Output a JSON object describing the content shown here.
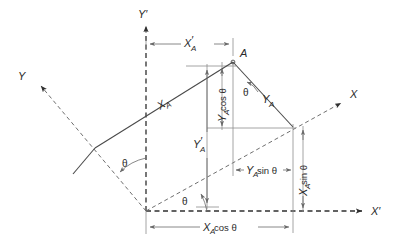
{
  "figure": {
    "type": "vector-diagram",
    "background_color": "#ffffff",
    "line_color": "#4a4a4a",
    "axis_color": "#2f2f2f",
    "dim_color": "#6a6a6a",
    "rotation_angle_symbol": "θ"
  },
  "axes": [
    {
      "id": "y-prime",
      "label": "Y",
      "prime": "′",
      "style": "dashed",
      "direction": "up",
      "from": [
        146,
        211
      ],
      "to": [
        146,
        22
      ],
      "arrow": true
    },
    {
      "id": "x-prime",
      "label": "X",
      "prime": "′",
      "style": "dashed",
      "direction": "right",
      "from": [
        146,
        211
      ],
      "to": [
        366,
        211
      ],
      "arrow": true
    },
    {
      "id": "y-axis",
      "label": "Y",
      "prime": "",
      "style": "dashed",
      "direction": "up-left",
      "from": [
        146,
        211
      ],
      "to": [
        37,
        82
      ],
      "arrow": true
    },
    {
      "id": "x-axis",
      "label": "X",
      "prime": "",
      "style": "dashed",
      "direction": "up-right",
      "from": [
        146,
        211
      ],
      "to": [
        345,
        100
      ],
      "arrow": true
    }
  ],
  "axis_labels": {
    "y_prime": {
      "text": "Y′",
      "x": 140,
      "y": 18
    },
    "x_prime": {
      "text": "X′",
      "x": 372,
      "y": 214
    },
    "y": {
      "text": "Y",
      "x": 22,
      "y": 76
    },
    "x": {
      "text": "X",
      "x": 352,
      "y": 94
    }
  },
  "point": {
    "name": "A",
    "label": "A",
    "label_x": 240,
    "label_y": 55,
    "x": 233,
    "y": 62
  },
  "vectors": [
    {
      "id": "x-a-vector",
      "label": "X",
      "sub": "A",
      "description": "Component of A along rotated X axis, drawn from the foot on the Y axis up to point A",
      "from": [
        95,
        148
      ],
      "to": [
        233,
        62
      ],
      "label_x": 163,
      "label_y": 107,
      "label_rotate": -32
    },
    {
      "id": "y-a-vector",
      "label": "Y",
      "sub": "A",
      "description": "Component of A along rotated Y axis, drawn from point A down to the X axis",
      "from": [
        233,
        62
      ],
      "to": [
        293,
        127
      ],
      "label_x": 266,
      "label_y": 103,
      "label_rotate": 0
    }
  ],
  "dimensions": [
    {
      "id": "x-prime-a",
      "text": "X",
      "sub": "A",
      "prime": "′",
      "suffix": "",
      "orientation": "horizontal",
      "from": [
        146,
        44
      ],
      "to": [
        233,
        44
      ],
      "label_x": 186,
      "label_y": 41,
      "description": "X' coordinate of point A"
    },
    {
      "id": "y-prime-a",
      "text": "Y",
      "sub": "A",
      "prime": "′",
      "suffix": "",
      "orientation": "vertical",
      "from": [
        207,
        67
      ],
      "to": [
        207,
        207
      ],
      "label_x": 198,
      "label_y": 145,
      "description": "Y' coordinate of point A"
    },
    {
      "id": "y-a-cos-theta",
      "text": "Y",
      "sub": "A",
      "prime": "",
      "suffix": " cos θ",
      "orientation": "vertical",
      "from": [
        222,
        66
      ],
      "to": [
        222,
        128
      ],
      "label_x": 219,
      "label_y": 97,
      "description": "Vertical projection of the Y_A component"
    },
    {
      "id": "y-a-sin-theta",
      "text": "Y",
      "sub": "A",
      "prime": "",
      "suffix": " sin θ",
      "orientation": "horizontal",
      "from": [
        233,
        170
      ],
      "to": [
        293,
        170
      ],
      "label_x": 263,
      "label_y": 167,
      "description": "Horizontal projection of the Y_A component"
    },
    {
      "id": "x-a-sin-theta",
      "text": "X",
      "sub": "A",
      "prime": "",
      "suffix": " sin θ",
      "orientation": "vertical",
      "from": [
        303,
        128
      ],
      "to": [
        303,
        210
      ],
      "label_x": 300,
      "label_y": 170,
      "description": "Vertical projection of the X_A component"
    },
    {
      "id": "x-a-cos-theta",
      "text": "X",
      "sub": "A",
      "prime": "",
      "suffix": " cos θ",
      "orientation": "horizontal",
      "from": [
        146,
        227
      ],
      "to": [
        293,
        227
      ],
      "label_x": 220,
      "label_y": 236,
      "description": "Horizontal projection of the X_A component"
    }
  ],
  "angles": [
    {
      "id": "theta-at-point-a",
      "label": "θ",
      "x": 249,
      "y": 95,
      "description": "Angle at A between the vertical drop line and the Y_A component"
    },
    {
      "id": "theta-yy-prime",
      "label": "θ",
      "x": 126,
      "y": 167,
      "description": "Rotation angle between the Y axis and the Y' axis"
    },
    {
      "id": "theta-xx-prime",
      "label": "θ",
      "x": 186,
      "y": 202,
      "description": "Rotation angle between the X axis and the X' axis"
    }
  ],
  "construction_lines": [
    {
      "id": "a-drop-line",
      "from": [
        233,
        62
      ],
      "to": [
        233,
        174
      ],
      "description": "Vertical drop from A"
    },
    {
      "id": "a-top-horizontal",
      "from": [
        186,
        66
      ],
      "to": [
        233,
        66
      ],
      "description": "Horizontal tick at top of Y_A cos theta"
    },
    {
      "id": "y-a-foot-horizontal",
      "from": [
        207,
        128
      ],
      "to": [
        293,
        128
      ],
      "description": "Horizontal through the foot of Y_A on the X axis"
    },
    {
      "id": "y-prime-a-tick",
      "from": [
        196,
        207
      ],
      "to": [
        219,
        207
      ],
      "description": "Lower tick of Y'_A dimension"
    },
    {
      "id": "x-a-sin-vertical",
      "from": [
        293,
        127
      ],
      "to": [
        293,
        215
      ],
      "description": "Vertical from X axis intercept down to X' axis"
    },
    {
      "id": "x-a-cos-tick",
      "from": [
        146,
        211
      ],
      "to": [
        146,
        232
      ],
      "description": "Left tick for X_A cos theta dimension"
    }
  ]
}
